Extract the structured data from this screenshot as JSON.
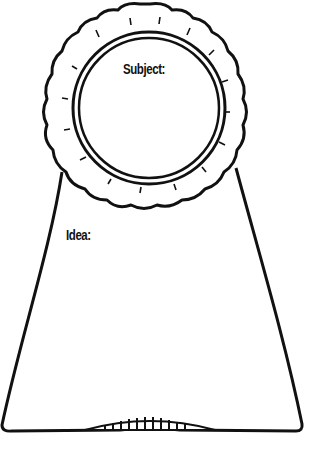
{
  "worksheet": {
    "subject_label": "Subject:",
    "idea_label": "Idea:"
  },
  "colors": {
    "ink": "#111111",
    "paper": "#ffffff"
  }
}
